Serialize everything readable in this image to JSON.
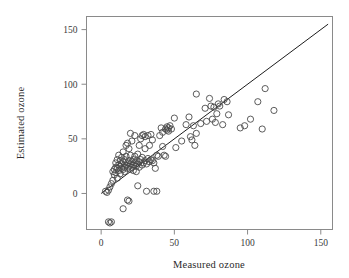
{
  "chart_data": {
    "type": "scatter",
    "title": "",
    "xlabel": "Measured ozone",
    "ylabel": "Estimated ozone",
    "xlim": [
      -10,
      158
    ],
    "ylim": [
      -33,
      162
    ],
    "xticks": [
      0,
      50,
      100,
      150
    ],
    "yticks": [
      0,
      50,
      100,
      150
    ],
    "xtick_labels": [
      "0",
      "50",
      "100",
      "150"
    ],
    "ytick_labels": [
      "0",
      "50",
      "100",
      "150"
    ],
    "grid": false,
    "legend": null,
    "annotations": [],
    "reference_line": {
      "name": "identity-line",
      "type": "line",
      "equation": "y = x",
      "x": [
        0,
        155
      ],
      "y": [
        0,
        155
      ]
    },
    "marker": {
      "shape": "open-circle",
      "radius": 3.1,
      "stroke": "#4a4a4a",
      "fill": "none"
    },
    "points": [
      [
        3,
        2
      ],
      [
        4,
        1
      ],
      [
        5,
        3
      ],
      [
        5,
        -26
      ],
      [
        6,
        -27
      ],
      [
        7,
        -26
      ],
      [
        6,
        6
      ],
      [
        7,
        9
      ],
      [
        8,
        12
      ],
      [
        8,
        20
      ],
      [
        9,
        22
      ],
      [
        9,
        17
      ],
      [
        10,
        24
      ],
      [
        10,
        19
      ],
      [
        10,
        28
      ],
      [
        11,
        23
      ],
      [
        11,
        31
      ],
      [
        11,
        14
      ],
      [
        12,
        26
      ],
      [
        12,
        21
      ],
      [
        12,
        35
      ],
      [
        13,
        25
      ],
      [
        13,
        30
      ],
      [
        13,
        18
      ],
      [
        14,
        23
      ],
      [
        14,
        27
      ],
      [
        14,
        33
      ],
      [
        15,
        22
      ],
      [
        15,
        29
      ],
      [
        15,
        38
      ],
      [
        15,
        -14
      ],
      [
        16,
        24
      ],
      [
        16,
        31
      ],
      [
        16,
        20
      ],
      [
        17,
        26
      ],
      [
        17,
        34
      ],
      [
        17,
        44
      ],
      [
        18,
        23
      ],
      [
        18,
        28
      ],
      [
        18,
        46
      ],
      [
        18,
        -6
      ],
      [
        19,
        -7
      ],
      [
        19,
        25
      ],
      [
        19,
        30
      ],
      [
        19,
        41
      ],
      [
        20,
        22
      ],
      [
        20,
        27
      ],
      [
        20,
        35
      ],
      [
        20,
        55
      ],
      [
        21,
        24
      ],
      [
        21,
        29
      ],
      [
        21,
        48
      ],
      [
        22,
        26
      ],
      [
        22,
        31
      ],
      [
        22,
        21
      ],
      [
        23,
        28
      ],
      [
        23,
        34
      ],
      [
        23,
        53
      ],
      [
        24,
        25
      ],
      [
        24,
        30
      ],
      [
        24,
        20
      ],
      [
        25,
        27
      ],
      [
        25,
        36
      ],
      [
        25,
        7
      ],
      [
        26,
        29
      ],
      [
        26,
        24
      ],
      [
        26,
        44
      ],
      [
        27,
        31
      ],
      [
        27,
        50
      ],
      [
        28,
        26
      ],
      [
        28,
        33
      ],
      [
        28,
        53
      ],
      [
        29,
        28
      ],
      [
        29,
        54
      ],
      [
        30,
        30
      ],
      [
        30,
        41
      ],
      [
        30,
        52
      ],
      [
        31,
        27
      ],
      [
        31,
        2
      ],
      [
        32,
        32
      ],
      [
        32,
        53
      ],
      [
        33,
        29
      ],
      [
        33,
        44
      ],
      [
        34,
        31
      ],
      [
        34,
        54
      ],
      [
        35,
        30
      ],
      [
        35,
        49
      ],
      [
        36,
        28
      ],
      [
        36,
        2
      ],
      [
        37,
        23
      ],
      [
        38,
        2
      ],
      [
        38,
        35
      ],
      [
        39,
        34
      ],
      [
        40,
        53
      ],
      [
        41,
        60
      ],
      [
        42,
        43
      ],
      [
        42,
        56
      ],
      [
        43,
        35
      ],
      [
        44,
        34
      ],
      [
        44,
        59
      ],
      [
        45,
        58
      ],
      [
        45,
        61
      ],
      [
        46,
        57
      ],
      [
        46,
        60
      ],
      [
        47,
        62
      ],
      [
        48,
        59
      ],
      [
        50,
        69
      ],
      [
        51,
        42
      ],
      [
        55,
        48
      ],
      [
        58,
        63
      ],
      [
        60,
        70
      ],
      [
        61,
        52
      ],
      [
        62,
        49
      ],
      [
        63,
        62
      ],
      [
        64,
        44
      ],
      [
        65,
        91
      ],
      [
        65,
        55
      ],
      [
        68,
        64
      ],
      [
        71,
        78
      ],
      [
        72,
        66
      ],
      [
        74,
        87
      ],
      [
        75,
        80
      ],
      [
        76,
        68
      ],
      [
        77,
        79
      ],
      [
        78,
        65
      ],
      [
        79,
        73
      ],
      [
        80,
        82
      ],
      [
        81,
        80
      ],
      [
        83,
        63
      ],
      [
        84,
        86
      ],
      [
        86,
        84
      ],
      [
        87,
        72
      ],
      [
        95,
        60
      ],
      [
        98,
        62
      ],
      [
        102,
        68
      ],
      [
        107,
        84
      ],
      [
        110,
        59
      ],
      [
        112,
        96
      ],
      [
        118,
        76
      ]
    ]
  },
  "figure": {
    "background": "#ffffff",
    "frame_color": "#8a8a8a",
    "line_color": "#1d1d1d",
    "marker_color": "#4a4a4a"
  }
}
